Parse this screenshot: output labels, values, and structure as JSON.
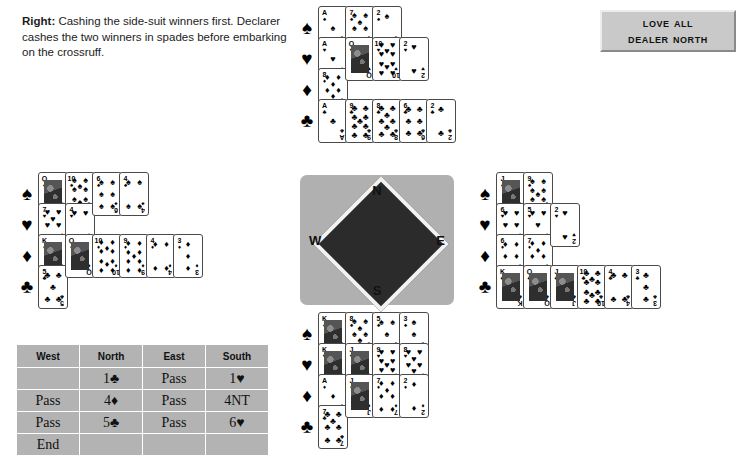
{
  "caption": {
    "lead": "Right:",
    "text": " Cashing the side-suit winners first. Declarer cashes the two winners in spades before embarking on the crossruff."
  },
  "vulnerability_box": {
    "line1": "Love All",
    "line2": "Dealer North"
  },
  "compass": {
    "north": "N",
    "south": "S",
    "west": "W",
    "east": "E"
  },
  "suit_symbols": {
    "spade": "♠",
    "heart": "♥",
    "diamond": "♦",
    "club": "♣"
  },
  "hands": {
    "north": {
      "label": "North",
      "suits": [
        {
          "suit": "spade",
          "symbol": "♠",
          "ranks": [
            "A",
            "7",
            "2"
          ]
        },
        {
          "suit": "heart",
          "symbol": "♥",
          "ranks": [
            "A",
            "Q",
            "10",
            "2"
          ]
        },
        {
          "suit": "diamond",
          "symbol": "♦",
          "ranks": [
            "8"
          ]
        },
        {
          "suit": "club",
          "symbol": "♣",
          "ranks": [
            "A",
            "9",
            "8",
            "6",
            "2"
          ]
        }
      ]
    },
    "west": {
      "label": "West",
      "suits": [
        {
          "suit": "spade",
          "symbol": "♠",
          "ranks": [
            "Q",
            "10",
            "6",
            "4"
          ]
        },
        {
          "suit": "heart",
          "symbol": "♥",
          "ranks": [
            "7",
            "4"
          ]
        },
        {
          "suit": "diamond",
          "symbol": "♦",
          "ranks": [
            "K",
            "Q",
            "10",
            "9",
            "4",
            "3"
          ]
        },
        {
          "suit": "club",
          "symbol": "♣",
          "ranks": [
            "5"
          ]
        }
      ]
    },
    "east": {
      "label": "East",
      "suits": [
        {
          "suit": "spade",
          "symbol": "♠",
          "ranks": [
            "J",
            "9"
          ]
        },
        {
          "suit": "heart",
          "symbol": "♥",
          "ranks": [
            "6",
            "5",
            "2"
          ]
        },
        {
          "suit": "diamond",
          "symbol": "♦",
          "ranks": [
            "6",
            "7"
          ]
        },
        {
          "suit": "club",
          "symbol": "♣",
          "ranks": [
            "K",
            "Q",
            "J",
            "10",
            "4",
            "3"
          ]
        }
      ]
    },
    "south": {
      "label": "South",
      "suits": [
        {
          "suit": "spade",
          "symbol": "♠",
          "ranks": [
            "K",
            "8",
            "5",
            "3"
          ]
        },
        {
          "suit": "heart",
          "symbol": "♥",
          "ranks": [
            "K",
            "J",
            "9",
            "8"
          ]
        },
        {
          "suit": "diamond",
          "symbol": "♦",
          "ranks": [
            "A",
            "J",
            "7",
            "2"
          ]
        },
        {
          "suit": "club",
          "symbol": "♣",
          "ranks": [
            "7"
          ]
        }
      ]
    }
  },
  "auction": {
    "headers": [
      "West",
      "North",
      "East",
      "South"
    ],
    "rows": [
      [
        "",
        "1♣",
        "Pass",
        "1♥"
      ],
      [
        "Pass",
        "4♦",
        "Pass",
        "4NT"
      ],
      [
        "Pass",
        "5♣",
        "Pass",
        "6♥"
      ],
      [
        "End",
        "",
        "",
        ""
      ]
    ]
  }
}
